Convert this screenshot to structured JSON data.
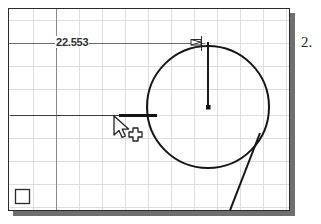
{
  "app": {
    "type": "cad-drawing-viewport",
    "background_color": "#ffffff",
    "frame_color": "#2b2b2b",
    "shadow_color": "#6e6e6e",
    "grid_color": "#dcdcdc",
    "geometry_color": "#1a1a1a",
    "dimension_color": "#555555"
  },
  "viewport": {
    "x": 8,
    "y": 8,
    "width": 282,
    "height": 203
  },
  "grid": {
    "visible": true,
    "cell_width": 23,
    "cell_height": 23,
    "color": "#dcdcdc"
  },
  "dimension": {
    "label": "22.553",
    "label_color": "#2e2e33",
    "line_y": 42,
    "line_start_x": 9,
    "line_end_x": 205,
    "arrow_end_x": 198
  },
  "geometry": {
    "circle": {
      "name": "circle",
      "center_x": 207,
      "center_y": 106,
      "radius": 61,
      "stroke_width": 2
    },
    "center_point": {
      "name": "center-point",
      "x": 207,
      "y": 106,
      "size": 4
    },
    "radius_line": {
      "name": "radius-line",
      "x1": 207,
      "y1": 106,
      "x2": 207,
      "y2": 41
    },
    "horizontal_line": {
      "name": "horizontal-line",
      "x1": 9,
      "y1": 114,
      "x2": 155,
      "y2": 114
    },
    "horizontal_line_highlight": {
      "name": "horizontal-line-selected-segment",
      "x1": 118,
      "y1": 114,
      "x2": 156,
      "y2": 114,
      "stroke_width": 3
    },
    "diagonal_line": {
      "name": "tangent-diagonal-line",
      "x1": 259,
      "y1": 132,
      "x2": 228,
      "y2": 212
    },
    "corner_square": {
      "name": "origin-corner-square",
      "x": 14,
      "y": 188,
      "size": 14
    },
    "vertical_reference_line": {
      "name": "vertical-reference-line",
      "x": 55,
      "y1": 9,
      "y2": 210
    }
  },
  "cursor": {
    "name": "cad-pick-cursor",
    "x": 108,
    "y": 111,
    "arrow": true,
    "crosshair": true
  },
  "page_label": {
    "text": "2."
  }
}
